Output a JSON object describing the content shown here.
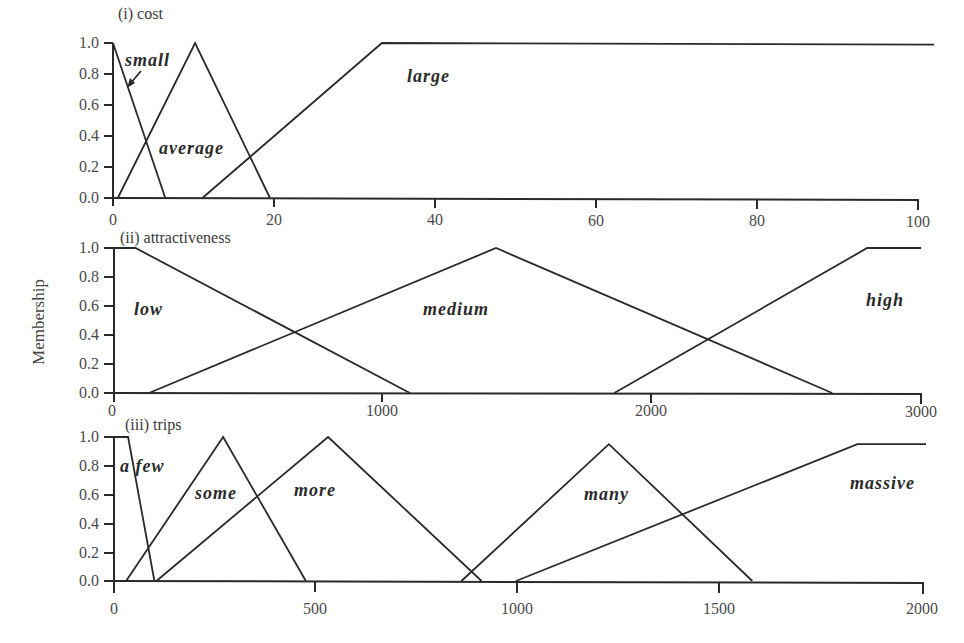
{
  "chart_data": [
    {
      "type": "line",
      "title": "(i) cost",
      "xlabel": "",
      "ylabel": "Membership",
      "xlim": [
        0,
        100
      ],
      "ylim": [
        0,
        1.0
      ],
      "x_ticks": [
        0,
        20,
        40,
        60,
        80,
        100
      ],
      "y_ticks": [
        "0.0",
        "0.2",
        "0.4",
        "0.6",
        "0.8",
        "1.0"
      ],
      "grid": false,
      "series": [
        {
          "name": "small",
          "x": [
            0,
            6.5
          ],
          "y": [
            1.0,
            0.0
          ]
        },
        {
          "name": "average",
          "x": [
            0.6,
            10.2,
            19.5
          ],
          "y": [
            0.0,
            1.0,
            0.0
          ]
        },
        {
          "name": "large",
          "x": [
            11.1,
            33.4,
            102
          ],
          "y": [
            0.0,
            1.0,
            0.99
          ]
        }
      ],
      "annotations": [
        "small (arrow pointing to small curve)",
        "average",
        "large"
      ]
    },
    {
      "type": "line",
      "title": "(ii) attractiveness",
      "xlabel": "",
      "ylabel": "Membership",
      "xlim": [
        0,
        3000
      ],
      "ylim": [
        0,
        1.0
      ],
      "x_ticks": [
        0,
        1000,
        2000,
        3000
      ],
      "y_ticks": [
        "0.0",
        "0.2",
        "0.4",
        "0.6",
        "0.8",
        "1.0"
      ],
      "grid": false,
      "series": [
        {
          "name": "low",
          "x": [
            0,
            80,
            1100
          ],
          "y": [
            1.0,
            1.0,
            0.0
          ]
        },
        {
          "name": "medium",
          "x": [
            130,
            1420,
            2670
          ],
          "y": [
            0.0,
            1.0,
            0.0
          ]
        },
        {
          "name": "high",
          "x": [
            1860,
            2800,
            3000
          ],
          "y": [
            0.0,
            1.0,
            1.0
          ]
        }
      ]
    },
    {
      "type": "line",
      "title": "(iii) trips",
      "xlabel": "",
      "ylabel": "Membership",
      "xlim": [
        0,
        2000
      ],
      "ylim": [
        0,
        1.0
      ],
      "x_ticks": [
        0,
        500,
        1000,
        1500,
        2000
      ],
      "y_ticks": [
        "0.0",
        "0.2",
        "0.4",
        "0.6",
        "0.8",
        "1.0"
      ],
      "grid": false,
      "series": [
        {
          "name": "a few",
          "x": [
            0,
            35,
            100
          ],
          "y": [
            1.0,
            1.0,
            0.0
          ]
        },
        {
          "name": "some",
          "x": [
            30,
            270,
            475
          ],
          "y": [
            0.0,
            1.0,
            0.0
          ]
        },
        {
          "name": "more",
          "x": [
            105,
            530,
            910
          ],
          "y": [
            0.0,
            1.0,
            0.0
          ]
        },
        {
          "name": "many",
          "x": [
            860,
            1225,
            1580
          ],
          "y": [
            0.0,
            0.95,
            0.0
          ]
        },
        {
          "name": "massive",
          "x": [
            995,
            1840,
            2010
          ],
          "y": [
            0.0,
            0.95,
            0.95
          ]
        }
      ]
    }
  ],
  "figure": {
    "ylabel": "Membership",
    "panels": [
      {
        "title": "(i) cost",
        "x_tick_labels": [
          "0",
          "20",
          "40",
          "60",
          "80",
          "100"
        ],
        "y_tick_labels": [
          "0.0",
          "0.2",
          "0.4",
          "0.6",
          "0.8",
          "1.0"
        ],
        "set_labels": [
          "small",
          "average",
          "large"
        ]
      },
      {
        "title": "(ii) attractiveness",
        "x_tick_labels": [
          "0",
          "1000",
          "2000",
          "3000"
        ],
        "y_tick_labels": [
          "0.0",
          "0.2",
          "0.4",
          "0.6",
          "0.8",
          "1.0"
        ],
        "set_labels": [
          "low",
          "medium",
          "high"
        ]
      },
      {
        "title": "(iii) trips",
        "x_tick_labels": [
          "0",
          "500",
          "1000",
          "1500",
          "2000"
        ],
        "y_tick_labels": [
          "0.0",
          "0.2",
          "0.4",
          "0.6",
          "0.8",
          "1.0"
        ],
        "set_labels": [
          "a few",
          "some",
          "more",
          "many",
          "massive"
        ]
      }
    ]
  }
}
